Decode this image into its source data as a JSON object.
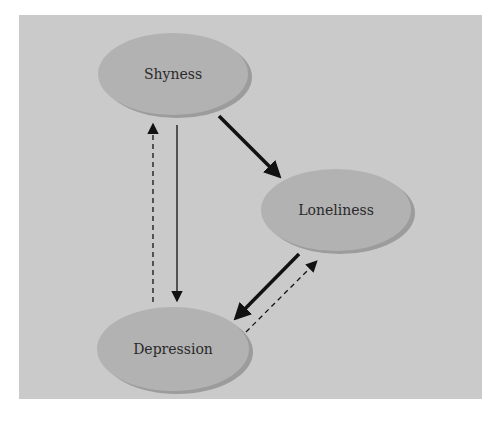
{
  "diagram": {
    "nodes": [
      {
        "id": "shyness",
        "label": "Shyness"
      },
      {
        "id": "loneliness",
        "label": "Loneliness"
      },
      {
        "id": "depression",
        "label": "Depression"
      }
    ],
    "edges": [
      {
        "from": "shyness",
        "to": "loneliness",
        "style": "solid-bold"
      },
      {
        "from": "shyness",
        "to": "depression",
        "style": "solid-thin"
      },
      {
        "from": "depression",
        "to": "shyness",
        "style": "dashed"
      },
      {
        "from": "loneliness",
        "to": "depression",
        "style": "solid-bold"
      },
      {
        "from": "depression",
        "to": "loneliness",
        "style": "dashed"
      }
    ],
    "colors": {
      "background": "#cacaca",
      "node_fill": "#b2b2b2",
      "node_shadow": "#9c9c9c",
      "arrow": "#111111"
    }
  }
}
